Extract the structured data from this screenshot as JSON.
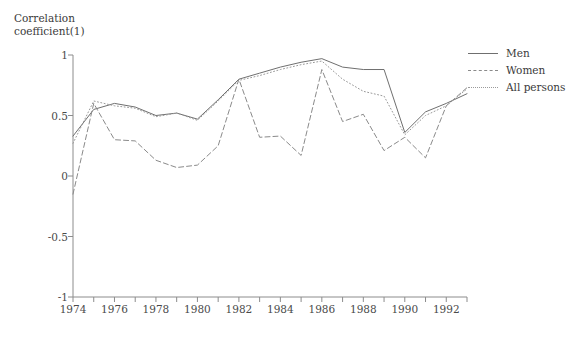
{
  "chart_data": {
    "type": "line",
    "title": "",
    "ylabel": "Correlation\ncoefficient(1)",
    "xlabel": "",
    "ylim": [
      -1,
      1
    ],
    "xlim": [
      1974,
      1993
    ],
    "grid": false,
    "legend_position": "right",
    "y_ticks": [
      1,
      0.5,
      0,
      -0.5,
      -1
    ],
    "y_tick_labels": [
      "1",
      "0.5",
      "0",
      "-0.5",
      "-1"
    ],
    "x_ticks": [
      1974,
      1976,
      1978,
      1980,
      1982,
      1984,
      1986,
      1988,
      1990,
      1992
    ],
    "x_tick_labels": [
      "1974",
      "1976",
      "1978",
      "1980",
      "1982",
      "1984",
      "1986",
      "1988",
      "1990",
      "1992"
    ],
    "x_minor_ticks": [
      1974,
      1975,
      1976,
      1977,
      1978,
      1979,
      1980,
      1981,
      1982,
      1983,
      1984,
      1985,
      1986,
      1987,
      1988,
      1989,
      1990,
      1991,
      1992,
      1993
    ],
    "x": [
      1974,
      1975,
      1976,
      1977,
      1978,
      1979,
      1980,
      1981,
      1982,
      1983,
      1984,
      1985,
      1986,
      1987,
      1988,
      1989,
      1990,
      1991,
      1992,
      1993
    ],
    "series": [
      {
        "name": "Men",
        "style": "solid",
        "color": "#6f6f6f",
        "values": [
          0.33,
          0.55,
          0.6,
          0.57,
          0.5,
          0.52,
          0.47,
          0.63,
          0.8,
          0.85,
          0.9,
          0.94,
          0.97,
          0.9,
          0.88,
          0.88,
          0.36,
          0.53,
          0.6,
          0.68
        ]
      },
      {
        "name": "Women",
        "style": "dashed",
        "color": "#8a8a8a",
        "values": [
          -0.15,
          0.6,
          0.3,
          0.29,
          0.13,
          0.07,
          0.09,
          0.25,
          0.8,
          0.32,
          0.33,
          0.17,
          0.88,
          0.45,
          0.51,
          0.21,
          0.32,
          0.15,
          0.58,
          0.73
        ]
      },
      {
        "name": "All persons",
        "style": "dotted",
        "color": "#9a9a9a",
        "values": [
          0.27,
          0.62,
          0.58,
          0.56,
          0.49,
          0.52,
          0.46,
          0.62,
          0.79,
          0.83,
          0.88,
          0.92,
          0.95,
          0.8,
          0.7,
          0.66,
          0.34,
          0.5,
          0.58,
          0.72
        ]
      }
    ]
  },
  "axes": {
    "axis_color": "#8c8c8c"
  },
  "legend": {
    "items": [
      {
        "label": "Men"
      },
      {
        "label": "Women"
      },
      {
        "label": "All persons"
      }
    ]
  }
}
